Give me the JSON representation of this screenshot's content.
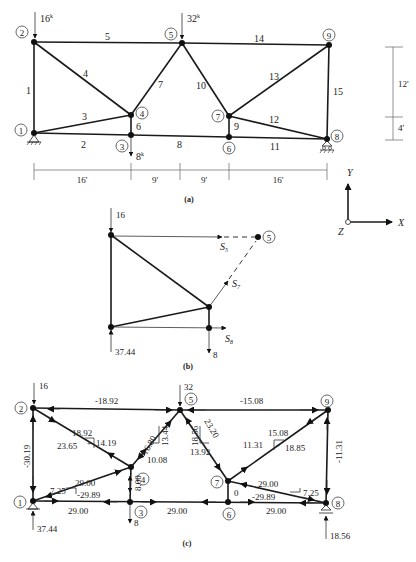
{
  "figure_a": {
    "caption": "(a)",
    "loads": [
      {
        "node": 2,
        "label": "16",
        "unit": "k"
      },
      {
        "node": 5,
        "label": "32",
        "unit": "k"
      },
      {
        "node": 3,
        "label": "8",
        "unit": "k"
      }
    ],
    "nodes": [
      "1",
      "2",
      "3",
      "4",
      "5",
      "6",
      "7",
      "8",
      "9"
    ],
    "members": [
      "1",
      "2",
      "3",
      "4",
      "5",
      "6",
      "7",
      "8",
      "9",
      "10",
      "11",
      "12",
      "13",
      "14",
      "15"
    ],
    "horizontal_dims": [
      "16'",
      "9'",
      "9'",
      "16'"
    ],
    "vertical_dims": [
      "12'",
      "4'"
    ]
  },
  "axes": {
    "y": "Y",
    "x": "X",
    "z": "Z"
  },
  "figure_b": {
    "caption": "(b)",
    "load_top": "16",
    "reaction": "37.44",
    "load_bottom": "8",
    "node": "5",
    "forces": {
      "s5": "S",
      "s5_sub": "5",
      "s7": "S",
      "s7_sub": "7",
      "s8": "S",
      "s8_sub": "8"
    }
  },
  "figure_c": {
    "caption": "(c)",
    "loads": {
      "node2": "16",
      "node5": "32",
      "node3": "8"
    },
    "reactions": {
      "node1": "37.44",
      "node8": "18.56"
    },
    "nodes": [
      "1",
      "2",
      "3",
      "4",
      "5",
      "6",
      "7",
      "8",
      "9"
    ],
    "member_forces": {
      "m1": "-30.19",
      "m5": "-18.92",
      "m14": "-15.08",
      "m15": "-11.31",
      "m4_x": "18.92",
      "m4_y": "14.19",
      "m4_f": "23.65",
      "m4_sign": "+",
      "m7_f": "-16.80",
      "m7_y": "13.44",
      "m7_x": "10.08",
      "m10_y": "18.56",
      "m10_f": "23.20",
      "m10_x": "13.92",
      "m13_x": "15.08",
      "m13_y": "11.31",
      "m13_f": "18.85",
      "m13_sign": "+",
      "m3_x": "29.00",
      "m3_y": "7.25",
      "m3_f": "-29.89",
      "m2": "29.00",
      "m6": "8.00",
      "m8": "29.00",
      "m9": "0",
      "m12_x": "29.00",
      "m12_y": "7.25",
      "m12_f": "-29.89",
      "m11": "29.00"
    }
  }
}
